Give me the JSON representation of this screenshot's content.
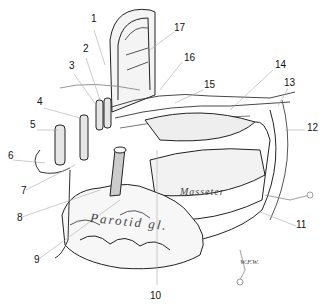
{
  "figure": {
    "in_figure_text": {
      "parotid": "Parotid gl.",
      "masseter": "Masseter",
      "signature": "W.F.W."
    },
    "labels": [
      {
        "n": "1",
        "x": 91,
        "y": 22
      },
      {
        "n": "2",
        "x": 83,
        "y": 52
      },
      {
        "n": "3",
        "x": 70,
        "y": 68
      },
      {
        "n": "4",
        "x": 39,
        "y": 103
      },
      {
        "n": "5",
        "x": 32,
        "y": 127
      },
      {
        "n": "6",
        "x": 9,
        "y": 157
      },
      {
        "n": "7",
        "x": 22,
        "y": 192
      },
      {
        "n": "8",
        "x": 17,
        "y": 219
      },
      {
        "n": "9",
        "x": 35,
        "y": 260
      },
      {
        "n": "10",
        "x": 154,
        "y": 295
      },
      {
        "n": "11",
        "x": 299,
        "y": 226
      },
      {
        "n": "12",
        "x": 308,
        "y": 128
      },
      {
        "n": "13",
        "x": 287,
        "y": 84
      },
      {
        "n": "14",
        "x": 276,
        "y": 66
      },
      {
        "n": "15",
        "x": 205,
        "y": 86
      },
      {
        "n": "16",
        "x": 184,
        "y": 58
      },
      {
        "n": "17",
        "x": 176,
        "y": 28
      }
    ]
  }
}
